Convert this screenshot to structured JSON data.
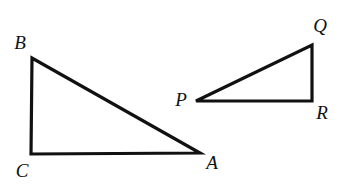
{
  "figure": {
    "type": "geometry-diagram",
    "background_color": "#ffffff",
    "stroke_color": "#111111",
    "stroke_width": 3.2,
    "width": 345,
    "height": 187
  },
  "shapes": [
    {
      "name": "triangle-abc",
      "label": "Triangle ABC",
      "right_angle_at": "C",
      "points": "32,58 31,154 200,153",
      "vertices": [
        {
          "id": "B",
          "label": "B",
          "x": 32,
          "y": 58
        },
        {
          "id": "C",
          "label": "C",
          "x": 31,
          "y": 154
        },
        {
          "id": "A",
          "label": "A",
          "x": 200,
          "y": 153
        }
      ]
    },
    {
      "name": "triangle-pqr",
      "label": "Triangle PQR",
      "right_angle_at": "R",
      "points": "196,101 312,45 312,101",
      "vertices": [
        {
          "id": "P",
          "label": "P",
          "x": 196,
          "y": 101
        },
        {
          "id": "Q",
          "label": "Q",
          "x": 312,
          "y": 45
        },
        {
          "id": "R",
          "label": "R",
          "x": 312,
          "y": 101
        }
      ]
    }
  ],
  "labels": [
    {
      "name": "vertex-label-b",
      "text": "B",
      "x": 20,
      "y": 42
    },
    {
      "name": "vertex-label-c",
      "text": "C",
      "x": 22,
      "y": 170
    },
    {
      "name": "vertex-label-a",
      "text": "A",
      "x": 212,
      "y": 162
    },
    {
      "name": "vertex-label-p",
      "text": "P",
      "x": 181,
      "y": 99
    },
    {
      "name": "vertex-label-q",
      "text": "Q",
      "x": 320,
      "y": 25
    },
    {
      "name": "vertex-label-r",
      "text": "R",
      "x": 322,
      "y": 112
    }
  ]
}
